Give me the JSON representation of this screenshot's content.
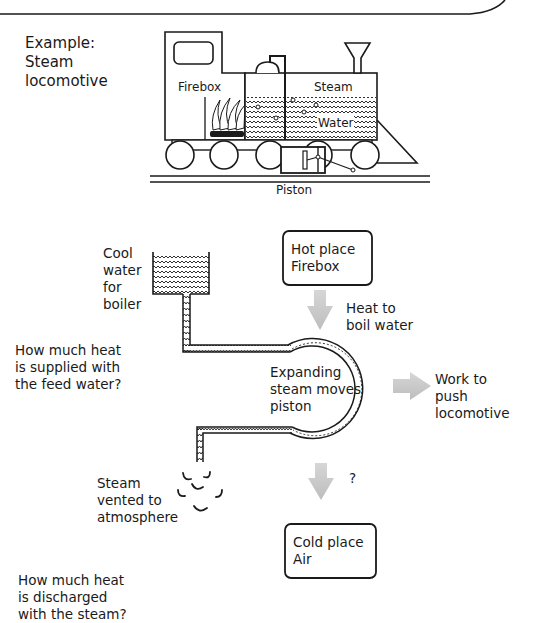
{
  "locomotive": {
    "caption": "Example:\nSteam\nlocomotive",
    "labels": {
      "firebox": "Firebox",
      "steam": "Steam",
      "water": "Water",
      "piston": "Piston"
    }
  },
  "cycle": {
    "cool_water": "Cool\nwater\nfor\nboiler",
    "hot_place": "Hot place\nFirebox",
    "heat_in": "Heat to\nboil water",
    "expanding": "Expanding\nsteam moves\npiston",
    "work_out": "Work to\npush\nlocomotive",
    "question_mark": "?",
    "steam_vented": "Steam\nvented to\natmosphere",
    "cold_place": "Cold place\nAir"
  },
  "questions": {
    "feed_water": "How much heat\nis supplied with\nthe feed water?",
    "discharged": "How much heat\nis discharged\nwith the steam?"
  },
  "colors": {
    "ink": "#1a1a1a",
    "arrow_gray": "#c8c8c8"
  }
}
